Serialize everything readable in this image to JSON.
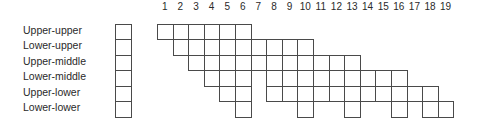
{
  "diagram": {
    "columns": [
      1,
      2,
      3,
      4,
      5,
      6,
      7,
      8,
      9,
      10,
      11,
      12,
      13,
      14,
      15,
      16,
      17,
      18,
      19
    ],
    "rows": [
      {
        "label": "Upper-upper",
        "cells": [
          1,
          2,
          3,
          4,
          5,
          6
        ]
      },
      {
        "label": "Lower-upper",
        "cells": [
          2,
          3,
          4,
          5,
          6,
          7,
          8,
          9,
          10
        ]
      },
      {
        "label": "Upper-middle",
        "cells": [
          3,
          4,
          5,
          6,
          7,
          8,
          9,
          10,
          11,
          12,
          13
        ]
      },
      {
        "label": "Lower-middle",
        "cells": [
          4,
          5,
          6,
          8,
          9,
          10,
          11,
          12,
          13,
          14,
          15,
          16
        ]
      },
      {
        "label": "Upper-lower",
        "cells": [
          5,
          6,
          8,
          9,
          10,
          11,
          12,
          13,
          14,
          15,
          16,
          17,
          18
        ]
      },
      {
        "label": "Lower-lower",
        "cells": [
          6,
          10,
          13,
          16,
          18,
          19
        ]
      }
    ],
    "line_color": "#4a4a4a",
    "text_color": "#2a2a2a"
  }
}
